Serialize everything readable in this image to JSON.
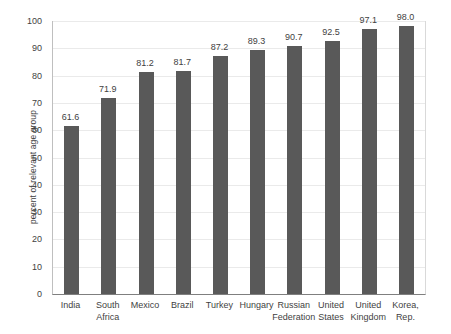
{
  "chart_data": {
    "type": "bar",
    "title": "",
    "subtitle": "",
    "xlabel": "",
    "ylabel": "percent of relevant age group",
    "ylim": [
      0,
      100
    ],
    "ytick_step": 10,
    "yticks": [
      "100",
      "90",
      "80",
      "70",
      "60",
      "50",
      "40",
      "30",
      "20",
      "10",
      "0"
    ],
    "grid": true,
    "legend": "none",
    "bar_color": "#595959",
    "gridline_color": "#eaeaea",
    "axis_color": "#7f7f7f",
    "categories": [
      "India",
      "South Africa",
      "Mexico",
      "Brazil",
      "Turkey",
      "Hungary",
      "Russian Federation",
      "United States",
      "United Kingdom",
      "Korea, Rep."
    ],
    "category_lines": [
      [
        "India"
      ],
      [
        "South",
        "Africa"
      ],
      [
        "Mexico"
      ],
      [
        "Brazil"
      ],
      [
        "Turkey"
      ],
      [
        "Hungary"
      ],
      [
        "Russian",
        "Federation"
      ],
      [
        "United",
        "States"
      ],
      [
        "United",
        "Kingdom"
      ],
      [
        "Korea,",
        "Rep."
      ]
    ],
    "values": [
      61.6,
      71.9,
      81.2,
      81.7,
      87.2,
      89.3,
      90.7,
      92.5,
      97.1,
      98.0
    ],
    "value_labels": [
      "61.6",
      "71.9",
      "81.2",
      "81.7",
      "87.2",
      "89.3",
      "90.7",
      "92.5",
      "97.1",
      "98.0"
    ]
  }
}
